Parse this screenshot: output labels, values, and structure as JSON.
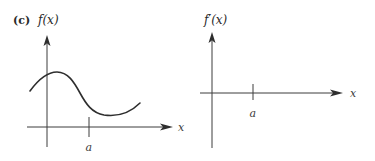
{
  "figure": {
    "panel_label": "(c)",
    "left_panel": {
      "y_label": "f(x)",
      "x_label": "x",
      "tick_label": "a",
      "curve_description": "smooth curve rising to a local maximum just right of the y-axis, falling through an inflection point before a, reaching a local minimum after a, then rising again"
    },
    "right_panel": {
      "y_label": "f′(x)",
      "x_label": "x",
      "tick_label": "a",
      "curve_description": "empty axes to sketch the derivative"
    }
  },
  "colors": {
    "ink": "#2e2e2e",
    "background": "#ffffff"
  }
}
